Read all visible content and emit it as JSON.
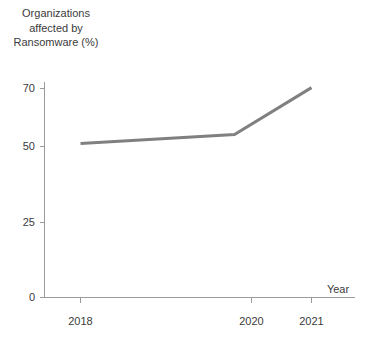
{
  "chart_data": {
    "type": "line",
    "title": "Organizations affected by Ransomware (%)",
    "title_lines": [
      "Organizations",
      "affected by",
      "Ransomware (%)"
    ],
    "xlabel": "Year",
    "ylabel": "",
    "categories": [
      "2018",
      "2020",
      "2021"
    ],
    "x": [
      2018,
      2020,
      2021
    ],
    "values": [
      51,
      54,
      69.5
    ],
    "series": [
      {
        "name": "Organizations affected by Ransomware (%)",
        "values": [
          51,
          54,
          69.5
        ],
        "color": "#808080"
      }
    ],
    "xlim": [
      2018,
      2021
    ],
    "ylim": [
      0,
      70
    ],
    "ytick_labels": [
      "0",
      "25",
      "50",
      "70"
    ],
    "ytick_values": [
      0,
      25,
      50,
      70
    ],
    "xtick_labels": [
      "2018",
      "2020",
      "2021"
    ],
    "grid": false,
    "legend": false,
    "axis_color": "#9a9a9a",
    "line_color": "#808080",
    "text_color": "#3b3b3b"
  },
  "axes": {
    "y_ticks": [
      {
        "label": "70",
        "value": 70
      },
      {
        "label": "50",
        "value": 50
      },
      {
        "label": "25",
        "value": 25
      },
      {
        "label": "0",
        "value": 0
      }
    ],
    "x_ticks": [
      {
        "label": "2018",
        "value": 2018
      },
      {
        "label": "2020",
        "value": 2020
      },
      {
        "label": "2021",
        "value": 2021
      }
    ],
    "x_axis_name": "Year"
  }
}
